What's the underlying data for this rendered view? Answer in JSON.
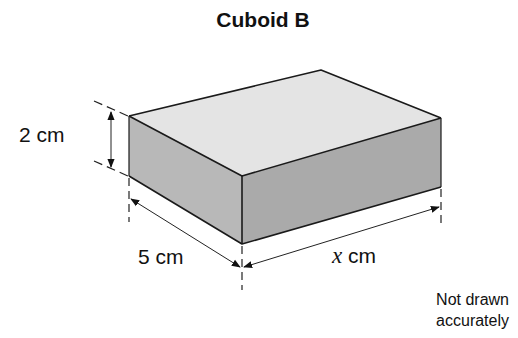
{
  "title": "Cuboid B",
  "dimensions": {
    "height": {
      "value": "2",
      "unit": "cm",
      "label": "2 cm"
    },
    "width": {
      "value": "5",
      "unit": "cm",
      "label": "5 cm"
    },
    "length": {
      "variable": "x",
      "unit": "cm",
      "unit_label": " cm"
    }
  },
  "note": {
    "line1": "Not drawn",
    "line2": "accurately"
  },
  "colors": {
    "top_face": "#e4e4e4",
    "left_face": "#b7b7b7",
    "right_face": "#a9a9a9",
    "edge": "#1a1a1a",
    "dimension_line": "#333333"
  }
}
